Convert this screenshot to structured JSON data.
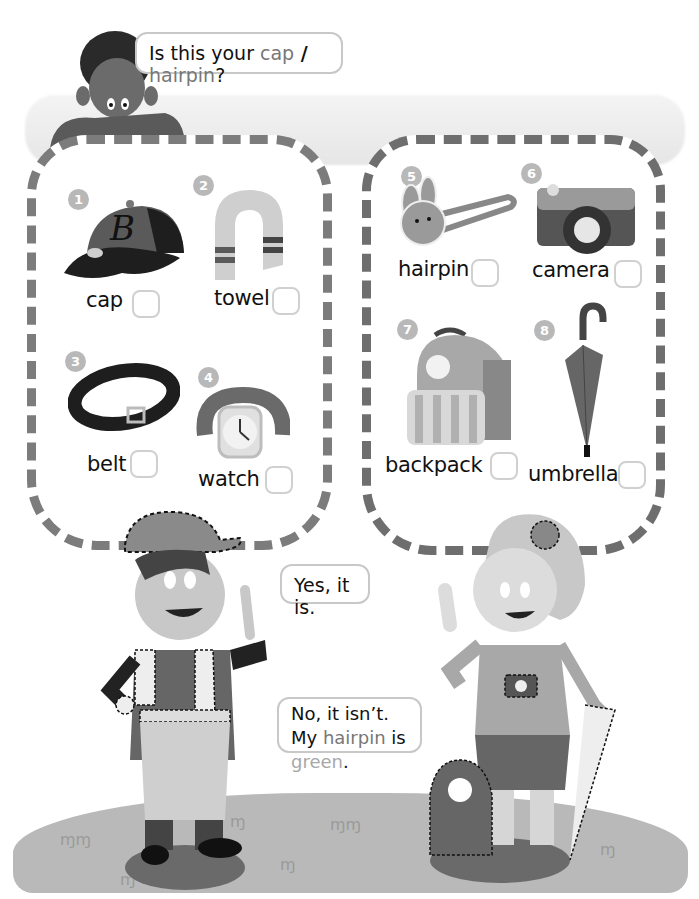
{
  "speech": {
    "question": {
      "prefix": "Is this your ",
      "option1": "cap",
      "separator": " / ",
      "option2": "hairpin",
      "suffix": "?"
    },
    "yes_answer": "Yes, it is.",
    "no_answer": {
      "line1": "No, it isn’t.",
      "line2_prefix": "My ",
      "line2_item": "hairpin",
      "line2_mid": " is ",
      "line2_color": "green",
      "line2_suffix": "."
    }
  },
  "items_left": [
    {
      "number": "1",
      "label": "cap",
      "icon": "cap-icon"
    },
    {
      "number": "2",
      "label": "towel",
      "icon": "towel-icon"
    },
    {
      "number": "3",
      "label": "belt",
      "icon": "belt-icon"
    },
    {
      "number": "4",
      "label": "watch",
      "icon": "watch-icon"
    }
  ],
  "items_right": [
    {
      "number": "5",
      "label": "hairpin",
      "icon": "hairpin-icon"
    },
    {
      "number": "6",
      "label": "camera",
      "icon": "camera-icon"
    },
    {
      "number": "7",
      "label": "backpack",
      "icon": "backpack-icon"
    },
    {
      "number": "8",
      "label": "umbrella",
      "icon": "umbrella-icon"
    }
  ],
  "cap_letter": "B",
  "colors": {
    "frame": "#7c7c7c",
    "badge": "#b8b8b8",
    "ground": "#b9b9b9",
    "checkbox_border": "#d0d0d0"
  }
}
